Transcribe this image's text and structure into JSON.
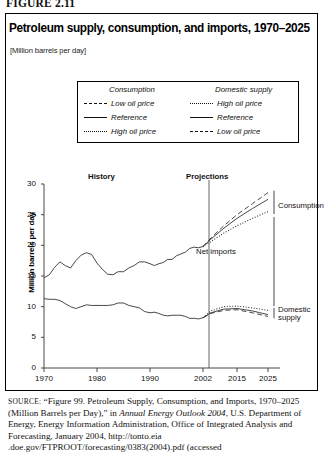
{
  "figure": {
    "label": "FIGURE 2.11"
  },
  "title": "Petroleum supply, consumption, and imports, 1970–2025",
  "subtitle": "[Million barrels per day]",
  "legend": {
    "columns": [
      {
        "heading": "Consumption",
        "entries": [
          {
            "label": "Low oil price",
            "style": "dash"
          },
          {
            "label": "Reference",
            "style": "solid"
          },
          {
            "label": "High oil price",
            "style": "dot"
          }
        ]
      },
      {
        "heading": "Domestic supply",
        "entries": [
          {
            "label": "High oil price",
            "style": "dot"
          },
          {
            "label": "Reference",
            "style": "solid"
          },
          {
            "label": "Low oil price",
            "style": "dash"
          }
        ]
      }
    ]
  },
  "annotations": {
    "history": "History",
    "projections": "Projections",
    "net_imports": "Net imports",
    "consumption": "Consumption",
    "domestic_supply_line1": "Domestic",
    "domestic_supply_line2": "supply"
  },
  "source": {
    "prefix": "SOURCE:",
    "text_1": "“Figure 99. Petroleum Supply, Consumption, and Imports, 1970–2025 (Million Barrels per Day),”  in ",
    "italic": "Annual Energy Outlook 2004",
    "text_2": ", U.S. Department of Energy, Energy Information Administration, Office of Integrated Analysis and Forecasting, January 2004, http://tonto.eia .doe.gov/FTPROOT/forecasting/0383(2004).pdf (accessed"
  },
  "chart_data": {
    "type": "line",
    "title": "Petroleum supply, consumption, and imports, 1970–2025",
    "subtitle": "[Million barrels per day]",
    "xlabel": "",
    "ylabel": "Million barrels per day",
    "ylim": [
      0,
      30
    ],
    "yticks": [
      0,
      5,
      10,
      15,
      20,
      25,
      30
    ],
    "xticks": [
      1970,
      1980,
      1990,
      2002,
      2015,
      2025
    ],
    "xlim": [
      1970,
      2025
    ],
    "grid": false,
    "legend_position": "above-plot",
    "history_projection_split": 2002,
    "series": [
      {
        "name": "Consumption Reference",
        "group": "Consumption",
        "style": "solid",
        "segment": "history",
        "x": [
          1970,
          1971,
          1972,
          1973,
          1974,
          1975,
          1976,
          1977,
          1978,
          1979,
          1980,
          1981,
          1982,
          1983,
          1984,
          1985,
          1986,
          1987,
          1988,
          1989,
          1990,
          1991,
          1992,
          1993,
          1994,
          1995,
          1996,
          1997,
          1998,
          1999,
          2000,
          2001,
          2002
        ],
        "values": [
          14.7,
          15.2,
          16.4,
          17.3,
          16.7,
          16.3,
          17.5,
          18.4,
          18.8,
          18.5,
          17.1,
          16.1,
          15.3,
          15.2,
          15.7,
          15.7,
          16.3,
          16.7,
          17.3,
          17.3,
          17.0,
          16.7,
          17.0,
          17.2,
          17.7,
          17.7,
          18.3,
          18.6,
          18.9,
          19.5,
          19.7,
          19.6,
          19.8
        ]
      },
      {
        "name": "Consumption Reference",
        "group": "Consumption",
        "style": "solid",
        "segment": "projection",
        "x": [
          2002,
          2005,
          2010,
          2015,
          2020,
          2025
        ],
        "values": [
          19.8,
          21.0,
          22.8,
          24.4,
          26.0,
          27.5
        ]
      },
      {
        "name": "Consumption Low oil price",
        "group": "Consumption",
        "style": "dash",
        "segment": "projection",
        "x": [
          2002,
          2005,
          2010,
          2015,
          2020,
          2025
        ],
        "values": [
          19.8,
          21.2,
          23.2,
          25.0,
          26.8,
          28.6
        ]
      },
      {
        "name": "Consumption High oil price",
        "group": "Consumption",
        "style": "dot",
        "segment": "projection",
        "x": [
          2002,
          2005,
          2010,
          2015,
          2020,
          2025
        ],
        "values": [
          19.8,
          20.6,
          22.0,
          23.2,
          24.4,
          25.5
        ]
      },
      {
        "name": "Domestic supply Reference",
        "group": "Domestic supply",
        "style": "solid",
        "segment": "history",
        "x": [
          1970,
          1971,
          1972,
          1973,
          1974,
          1975,
          1976,
          1977,
          1978,
          1979,
          1980,
          1981,
          1982,
          1983,
          1984,
          1985,
          1986,
          1987,
          1988,
          1989,
          1990,
          1991,
          1992,
          1993,
          1994,
          1995,
          1996,
          1997,
          1998,
          1999,
          2000,
          2001,
          2002
        ],
        "values": [
          11.3,
          11.2,
          11.2,
          11.0,
          10.5,
          10.0,
          9.7,
          10.0,
          10.3,
          10.2,
          10.2,
          10.2,
          10.2,
          10.3,
          10.6,
          10.6,
          10.2,
          10.0,
          9.8,
          9.2,
          9.0,
          9.1,
          8.9,
          8.6,
          8.5,
          8.6,
          8.6,
          8.6,
          8.4,
          8.1,
          8.1,
          8.0,
          8.2
        ]
      },
      {
        "name": "Domestic supply Reference",
        "group": "Domestic supply",
        "style": "solid",
        "segment": "projection",
        "x": [
          2002,
          2005,
          2010,
          2015,
          2020,
          2025
        ],
        "values": [
          8.2,
          9.0,
          9.6,
          9.7,
          9.3,
          8.7
        ]
      },
      {
        "name": "Domestic supply High oil price",
        "group": "Domestic supply",
        "style": "dot",
        "segment": "projection",
        "x": [
          2002,
          2005,
          2010,
          2015,
          2020,
          2025
        ],
        "values": [
          8.2,
          9.3,
          10.0,
          10.1,
          9.8,
          9.4
        ]
      },
      {
        "name": "Domestic supply Low oil price",
        "group": "Domestic supply",
        "style": "dash",
        "segment": "projection",
        "x": [
          2002,
          2005,
          2010,
          2015,
          2020,
          2025
        ],
        "values": [
          8.2,
          8.9,
          9.4,
          9.5,
          9.0,
          8.4
        ]
      }
    ],
    "annotations": [
      {
        "text": "History",
        "x": 1986,
        "y": 28.2
      },
      {
        "text": "Projections",
        "x": 2009,
        "y": 28.2
      },
      {
        "text": "Net imports",
        "x": 2012,
        "y": 16.0
      },
      {
        "text": "Consumption",
        "x": 2026,
        "y": 26.0
      },
      {
        "text": "Domestic supply",
        "x": 2026,
        "y": 8.8
      }
    ]
  }
}
